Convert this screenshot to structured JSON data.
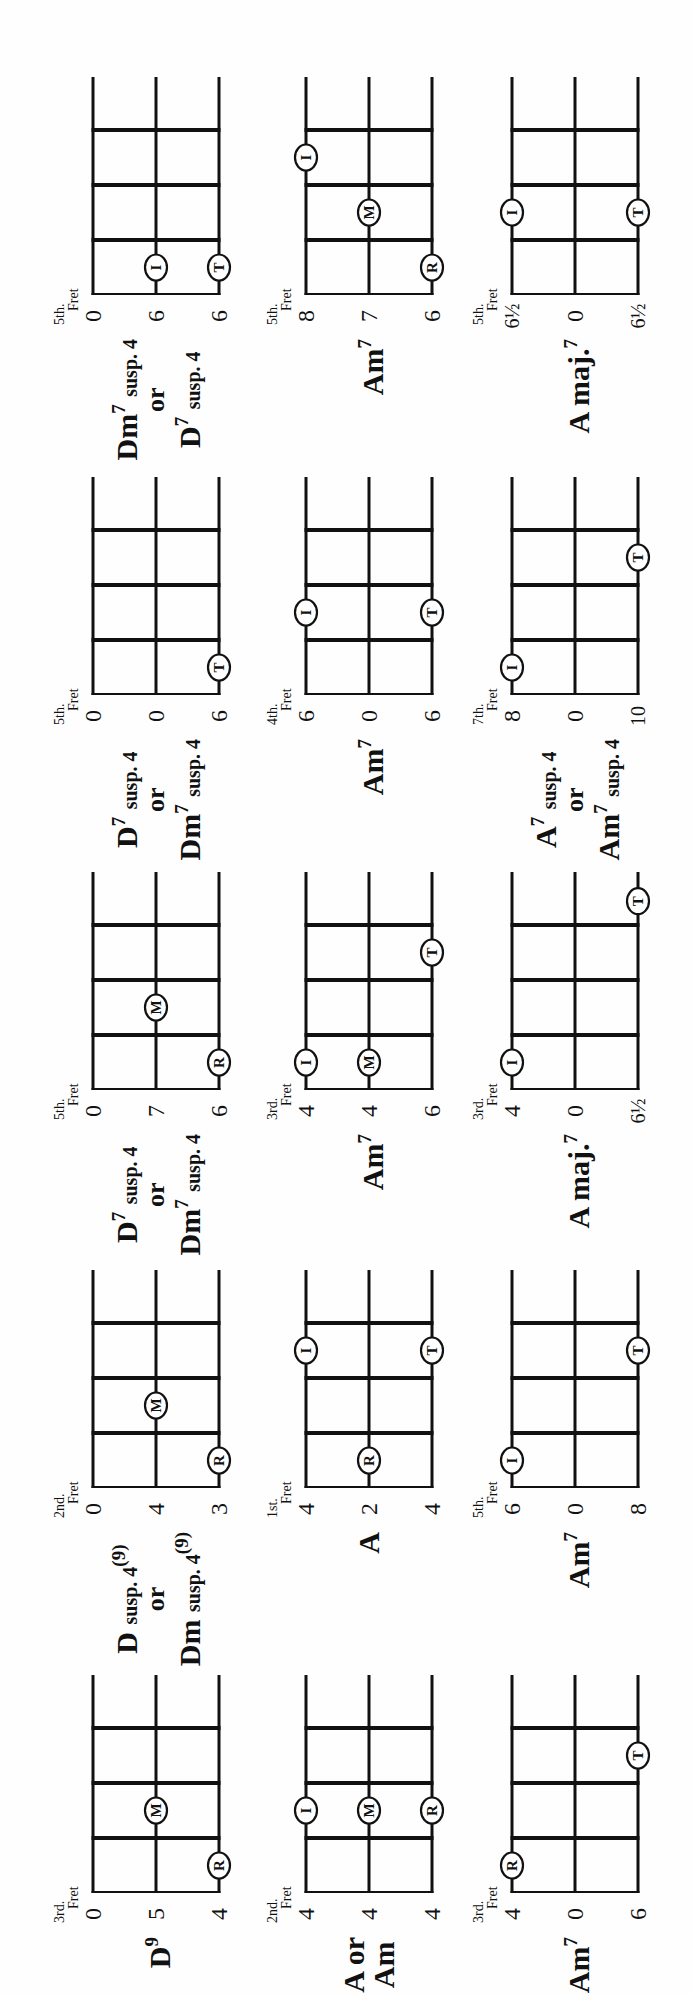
{
  "page": {
    "orientation": "rotated -90deg",
    "background": "#fefefe",
    "ink": "#111111"
  },
  "legend_letters": {
    "R": "Ring finger",
    "M": "Middle finger",
    "I": "Index finger",
    "T": "Thumb"
  },
  "chords": [
    {
      "col": 0,
      "row": 0,
      "name_html": "D<span class='sup'>9</span>",
      "name_text": "D9",
      "fret_label": "3rd.",
      "fret_word": "Fret",
      "strings": [
        "0",
        "5",
        "4"
      ],
      "dots": [
        {
          "s": 1,
          "sp": 2,
          "l": "M"
        },
        {
          "s": 2,
          "sp": 1,
          "l": "R"
        }
      ]
    },
    {
      "col": 0,
      "row": 1,
      "name_html": "<span class='ln'>A or</span><span class='ln'>Am</span>",
      "name_text": "A or Am",
      "fret_label": "2nd.",
      "fret_word": "Fret",
      "strings": [
        "4",
        "4",
        "4"
      ],
      "dots": [
        {
          "s": 0,
          "sp": 2,
          "l": "I"
        },
        {
          "s": 1,
          "sp": 2,
          "l": "M"
        },
        {
          "s": 2,
          "sp": 2,
          "l": "R"
        }
      ]
    },
    {
      "col": 0,
      "row": 2,
      "name_html": "Am<span class='sup'>7</span>",
      "name_text": "Am7",
      "fret_label": "3rd.",
      "fret_word": "Fret",
      "strings": [
        "4",
        "0",
        "6"
      ],
      "dots": [
        {
          "s": 0,
          "sp": 1,
          "l": "R"
        },
        {
          "s": 2,
          "sp": 3,
          "l": "T"
        }
      ]
    },
    {
      "col": 1,
      "row": 0,
      "name_html": "<span class='ln'>D <span class='sm'>susp. 4<span class='sup'>(9)</span></span></span><span class='or'>or</span><span class='ln'>Dm <span class='sm'>susp. 4<span class='sup'>(9)</span></span></span>",
      "name_text": "D susp. 4(9) or Dm susp. 4(9)",
      "fret_label": "2nd.",
      "fret_word": "Fret",
      "strings": [
        "0",
        "4",
        "3"
      ],
      "dots": [
        {
          "s": 1,
          "sp": 2,
          "l": "M"
        },
        {
          "s": 2,
          "sp": 1,
          "l": "R"
        }
      ]
    },
    {
      "col": 1,
      "row": 1,
      "name_html": "A",
      "name_text": "A",
      "fret_label": "1st.",
      "fret_word": "Fret",
      "strings": [
        "4",
        "2",
        "4"
      ],
      "dots": [
        {
          "s": 1,
          "sp": 1,
          "l": "R"
        },
        {
          "s": 0,
          "sp": 3,
          "l": "I"
        },
        {
          "s": 2,
          "sp": 3,
          "l": "T"
        }
      ]
    },
    {
      "col": 1,
      "row": 2,
      "name_html": "Am<span class='sup'>7</span>",
      "name_text": "Am7",
      "fret_label": "5th.",
      "fret_word": "Fret",
      "strings": [
        "6",
        "0",
        "8"
      ],
      "dots": [
        {
          "s": 0,
          "sp": 1,
          "l": "I"
        },
        {
          "s": 2,
          "sp": 3,
          "l": "T"
        }
      ]
    },
    {
      "col": 2,
      "row": 0,
      "name_html": "<span class='ln'>D<span class='sup'>7</span> <span class='sm'>susp. 4</span></span><span class='or'>or</span><span class='ln'>Dm<span class='sup'>7</span> <span class='sm'>susp. 4</span></span>",
      "name_text": "D7 susp. 4 or Dm7 susp. 4",
      "fret_label": "5th.",
      "fret_word": "Fret",
      "strings": [
        "0",
        "7",
        "6"
      ],
      "dots": [
        {
          "s": 1,
          "sp": 2,
          "l": "M"
        },
        {
          "s": 2,
          "sp": 1,
          "l": "R"
        }
      ]
    },
    {
      "col": 2,
      "row": 1,
      "name_html": "Am<span class='sup'>7</span>",
      "name_text": "Am7",
      "fret_label": "3rd.",
      "fret_word": "Fret",
      "strings": [
        "4",
        "4",
        "6"
      ],
      "dots": [
        {
          "s": 0,
          "sp": 1,
          "l": "I"
        },
        {
          "s": 1,
          "sp": 1,
          "l": "M"
        },
        {
          "s": 2,
          "sp": 3,
          "l": "T"
        }
      ]
    },
    {
      "col": 2,
      "row": 2,
      "name_html": "A maj.<span class='sup'>7</span>",
      "name_text": "A maj.7",
      "fret_label": "3rd.",
      "fret_word": "Fret",
      "strings": [
        "4",
        "0",
        "6½"
      ],
      "dots": [
        {
          "s": 0,
          "sp": 1,
          "l": "I"
        },
        {
          "s": 2,
          "sp": 4,
          "l": "T"
        }
      ]
    },
    {
      "col": 3,
      "row": 0,
      "name_html": "<span class='ln'>D<span class='sup'>7</span> <span class='sm'>susp. 4</span></span><span class='or'>or</span><span class='ln'>Dm<span class='sup'>7</span> <span class='sm'>susp. 4</span></span>",
      "name_text": "D7 susp. 4 or Dm7 susp. 4",
      "fret_label": "5th.",
      "fret_word": "Fret",
      "strings": [
        "0",
        "0",
        "6"
      ],
      "dots": [
        {
          "s": 2,
          "sp": 1,
          "l": "T"
        }
      ]
    },
    {
      "col": 3,
      "row": 1,
      "name_html": "Am<span class='sup'>7</span>",
      "name_text": "Am7",
      "fret_label": "4th.",
      "fret_word": "Fret",
      "strings": [
        "6",
        "0",
        "6"
      ],
      "dots": [
        {
          "s": 0,
          "sp": 2,
          "l": "I"
        },
        {
          "s": 2,
          "sp": 2,
          "l": "T"
        }
      ]
    },
    {
      "col": 3,
      "row": 2,
      "name_html": "<span class='ln'>A<span class='sup'>7</span> <span class='sm'>susp. 4</span></span><span class='or'>or</span><span class='ln'>Am<span class='sup'>7</span> <span class='sm'>susp. 4</span></span>",
      "name_text": "A7 susp. 4 or Am7 susp. 4",
      "fret_label": "7th.",
      "fret_word": "Fret",
      "strings": [
        "8",
        "0",
        "10"
      ],
      "dots": [
        {
          "s": 0,
          "sp": 1,
          "l": "I"
        },
        {
          "s": 2,
          "sp": 3,
          "l": "T"
        }
      ]
    },
    {
      "col": 4,
      "row": 0,
      "name_html": "<span class='ln'>Dm<span class='sup'>7</span> <span class='sm'>susp. 4</span></span><span class='or'>or</span><span class='ln'>D<span class='sup'>7</span> <span class='sm'>susp. 4</span></span>",
      "name_text": "Dm7 susp. 4 or D7 susp. 4",
      "fret_label": "5th.",
      "fret_word": "Fret",
      "strings": [
        "0",
        "6",
        "6"
      ],
      "dots": [
        {
          "s": 1,
          "sp": 1,
          "l": "I"
        },
        {
          "s": 2,
          "sp": 1,
          "l": "T"
        }
      ]
    },
    {
      "col": 4,
      "row": 1,
      "name_html": "Am<span class='sup'>7</span>",
      "name_text": "Am7",
      "fret_label": "5th.",
      "fret_word": "Fret",
      "strings": [
        "8",
        "7",
        "6"
      ],
      "dots": [
        {
          "s": 2,
          "sp": 1,
          "l": "R"
        },
        {
          "s": 1,
          "sp": 2,
          "l": "M"
        },
        {
          "s": 0,
          "sp": 3,
          "l": "I"
        }
      ]
    },
    {
      "col": 4,
      "row": 2,
      "name_html": "A maj.<span class='sup'>7</span>",
      "name_text": "A maj.7",
      "fret_label": "5th.",
      "fret_word": "Fret",
      "strings": [
        "6½",
        "0",
        "6½"
      ],
      "dots": [
        {
          "s": 0,
          "sp": 2,
          "l": "I"
        },
        {
          "s": 2,
          "sp": 2,
          "l": "T"
        }
      ]
    }
  ],
  "layout": {
    "col_nut_x": [
      101,
      506,
      904,
      1299,
      1699
    ],
    "row_top_y": [
      93,
      306,
      512
    ],
    "string_gap": 63,
    "fret_gap": 55,
    "open_ext": 53
  }
}
